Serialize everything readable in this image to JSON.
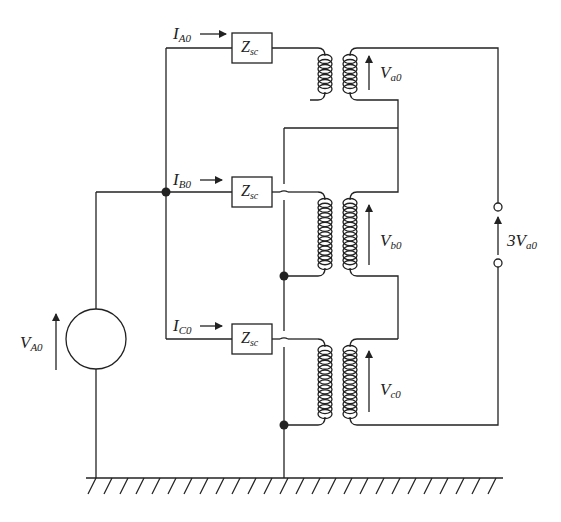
{
  "diagram": {
    "type": "circuit-schematic",
    "source": {
      "label_main": "V",
      "label_sub": "A0"
    },
    "currents": [
      {
        "id": "A",
        "label_main": "I",
        "label_sub": "A0"
      },
      {
        "id": "B",
        "label_main": "I",
        "label_sub": "B0"
      },
      {
        "id": "C",
        "label_main": "I",
        "label_sub": "C0"
      }
    ],
    "impedances": [
      {
        "label_main": "Z",
        "label_sub": "sc"
      },
      {
        "label_main": "Z",
        "label_sub": "sc"
      },
      {
        "label_main": "Z",
        "label_sub": "sc"
      }
    ],
    "secondary_voltages": [
      {
        "label_main": "V",
        "label_sub": "a0"
      },
      {
        "label_main": "V",
        "label_sub": "b0"
      },
      {
        "label_main": "V",
        "label_sub": "c0"
      }
    ],
    "open_delta_output": {
      "label_main": "3V",
      "label_sub": "a0"
    },
    "ground": "hatched ground reference",
    "colors": {
      "line": "#222222",
      "background": "#ffffff"
    }
  }
}
